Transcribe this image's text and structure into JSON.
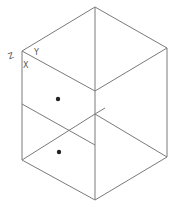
{
  "view": {
    "type": "isometric-wireframe",
    "background": "#ffffff",
    "line_color": "#7a7a7a",
    "point_color": "#222222"
  },
  "axes": {
    "z_label": "Z",
    "y_label": "Y",
    "x_label": "X"
  },
  "vertices": {
    "top": [
      95,
      7
    ],
    "right_top": [
      167,
      48
    ],
    "right_bottom": [
      167,
      157
    ],
    "bottom": [
      95,
      200
    ],
    "left_bottom": [
      22,
      160
    ],
    "left_top": [
      22,
      51
    ],
    "center_top": [
      95,
      91
    ],
    "left_mid": [
      22,
      104
    ],
    "center_mid_upper": [
      95,
      114
    ],
    "center_mid_lower": [
      95,
      145
    ]
  },
  "points": [
    {
      "name": "upper-point",
      "x": 58,
      "y": 99
    },
    {
      "name": "lower-point",
      "x": 59,
      "y": 152
    }
  ]
}
